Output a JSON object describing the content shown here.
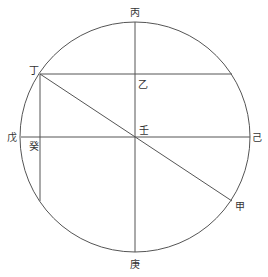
{
  "diagram": {
    "colors": {
      "stroke": "#555555",
      "text": "#333333",
      "background": "#ffffff"
    },
    "circle": {
      "cx": 135,
      "cy": 137,
      "r": 115
    },
    "labels": {
      "bing": "丙",
      "ding": "丁",
      "yi": "乙",
      "wu": "戊",
      "gui": "癸",
      "ren": "壬",
      "ji": "己",
      "jia": "甲",
      "geng": "庚"
    }
  }
}
